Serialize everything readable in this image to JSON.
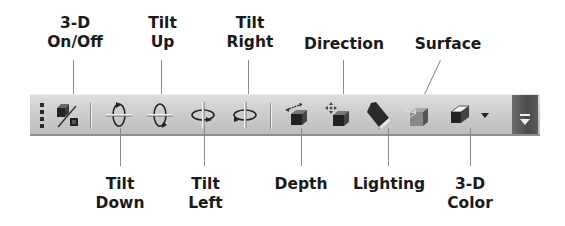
{
  "toolbar": {
    "name": "3-D Settings",
    "buttons": [
      {
        "id": "3d-on-off",
        "label_line1": "3-D",
        "label_line2": "On/Off",
        "icon": "3d-toggle-icon"
      },
      {
        "id": "tilt-down",
        "label_line1": "Tilt",
        "label_line2": "Down",
        "icon": "tilt-down-icon"
      },
      {
        "id": "tilt-up",
        "label_line1": "Tilt",
        "label_line2": "Up",
        "icon": "tilt-up-icon"
      },
      {
        "id": "tilt-left",
        "label_line1": "Tilt",
        "label_line2": "Left",
        "icon": "tilt-left-icon"
      },
      {
        "id": "tilt-right",
        "label_line1": "Tilt",
        "label_line2": "Right",
        "icon": "tilt-right-icon"
      },
      {
        "id": "depth",
        "label_line1": "Depth",
        "label_line2": "",
        "icon": "depth-icon"
      },
      {
        "id": "direction",
        "label_line1": "Direction",
        "label_line2": "",
        "icon": "direction-icon"
      },
      {
        "id": "lighting",
        "label_line1": "Lighting",
        "label_line2": "",
        "icon": "lighting-icon"
      },
      {
        "id": "surface",
        "label_line1": "Surface",
        "label_line2": "",
        "icon": "surface-icon"
      },
      {
        "id": "3d-color",
        "label_line1": "3-D",
        "label_line2": "Color",
        "icon": "3d-color-icon"
      }
    ]
  },
  "callouts": {
    "top": {
      "on_off": {
        "l1": "3-D",
        "l2": "On/Off"
      },
      "tilt_up": {
        "l1": "Tilt",
        "l2": "Up"
      },
      "tilt_right": {
        "l1": "Tilt",
        "l2": "Right"
      },
      "direction": {
        "l1": "Direction"
      },
      "surface": {
        "l1": "Surface"
      }
    },
    "bottom": {
      "tilt_down": {
        "l1": "Tilt",
        "l2": "Down"
      },
      "tilt_left": {
        "l1": "Tilt",
        "l2": "Left"
      },
      "depth": {
        "l1": "Depth"
      },
      "lighting": {
        "l1": "Lighting"
      },
      "color": {
        "l1": "3-D",
        "l2": "Color"
      }
    }
  },
  "colors": {
    "toolbar_bg": "#cfcfcf",
    "overflow_bg": "#4a4a4a",
    "label_text": "#1a1a1a",
    "leader_line": "#8a8a8a"
  }
}
